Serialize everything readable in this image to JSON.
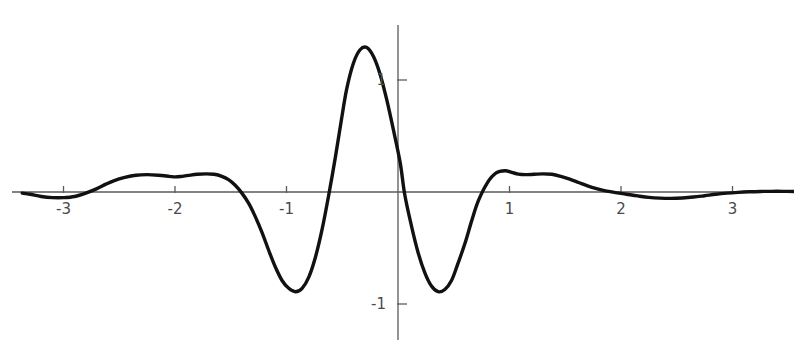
{
  "chart_data": {
    "type": "line",
    "title": "",
    "subtitle": "",
    "xlabel": "",
    "ylabel": "",
    "xlim": [
      -3.37,
      3.55
    ],
    "ylim": [
      -1.5,
      1.53
    ],
    "grid": false,
    "legend": null,
    "x_ticks": [
      -3,
      -2,
      -1,
      1,
      2,
      3
    ],
    "x_tick_labels": [
      "-3",
      "-2",
      "-1",
      "1",
      "2",
      "3"
    ],
    "y_ticks": [
      1,
      -1
    ],
    "y_tick_labels": [
      "1",
      "-1"
    ],
    "line_color": "#111111",
    "axis_color": "#5a5a5a",
    "background_color": "#ffffff",
    "annotations": [],
    "series": [
      {
        "name": "wavelet",
        "x": [
          -3.37,
          -3.3,
          -3.2,
          -3.1,
          -3.0,
          -2.9,
          -2.8,
          -2.7,
          -2.62,
          -2.55,
          -2.45,
          -2.35,
          -2.25,
          -2.15,
          -2.05,
          -2.0,
          -1.95,
          -1.88,
          -1.8,
          -1.72,
          -1.65,
          -1.58,
          -1.52,
          -1.46,
          -1.4,
          -1.34,
          -1.28,
          -1.22,
          -1.16,
          -1.1,
          -1.04,
          -0.98,
          -0.92,
          -0.86,
          -0.8,
          -0.74,
          -0.68,
          -0.62,
          -0.56,
          -0.51,
          -0.46,
          -0.4,
          -0.34,
          -0.28,
          -0.22,
          -0.16,
          -0.1,
          -0.04,
          0.02,
          0.06,
          0.12,
          0.18,
          0.24,
          0.3,
          0.36,
          0.42,
          0.48,
          0.53,
          0.6,
          0.66,
          0.72,
          0.8,
          0.88,
          0.96,
          1.02,
          1.08,
          1.14,
          1.22,
          1.3,
          1.38,
          1.46,
          1.54,
          1.62,
          1.7,
          1.78,
          1.86,
          1.95,
          2.05,
          2.15,
          2.25,
          2.35,
          2.45,
          2.55,
          2.65,
          2.75,
          2.85,
          2.95,
          3.05,
          3.15,
          3.25,
          3.35,
          3.45,
          3.55
        ],
        "y": [
          -0.01,
          -0.02,
          -0.04,
          -0.05,
          -0.05,
          -0.04,
          -0.01,
          0.03,
          0.07,
          0.1,
          0.13,
          0.15,
          0.155,
          0.15,
          0.14,
          0.135,
          0.138,
          0.148,
          0.158,
          0.162,
          0.158,
          0.14,
          0.11,
          0.06,
          -0.01,
          -0.1,
          -0.22,
          -0.36,
          -0.52,
          -0.67,
          -0.79,
          -0.86,
          -0.89,
          -0.86,
          -0.76,
          -0.58,
          -0.33,
          -0.02,
          0.32,
          0.63,
          0.92,
          1.15,
          1.27,
          1.29,
          1.21,
          1.05,
          0.82,
          0.55,
          0.26,
          -0.02,
          -0.3,
          -0.54,
          -0.72,
          -0.84,
          -0.89,
          -0.87,
          -0.79,
          -0.66,
          -0.46,
          -0.26,
          -0.08,
          0.08,
          0.17,
          0.19,
          0.175,
          0.16,
          0.155,
          0.158,
          0.162,
          0.158,
          0.14,
          0.115,
          0.085,
          0.055,
          0.03,
          0.01,
          -0.005,
          -0.02,
          -0.035,
          -0.048,
          -0.055,
          -0.057,
          -0.053,
          -0.045,
          -0.033,
          -0.02,
          -0.01,
          -0.003,
          0.002,
          0.005,
          0.006,
          0.006,
          0.005
        ]
      }
    ]
  },
  "plot": {
    "pixel_origin": {
      "x": 398,
      "y": 192
    },
    "pixel_scale": {
      "x_unit": 111.5,
      "y_unit": 112.0
    },
    "x_axis_extent_px": {
      "start": 12,
      "end": 788
    },
    "y_axis_extent_px": {
      "start": 25,
      "end": 340
    }
  }
}
